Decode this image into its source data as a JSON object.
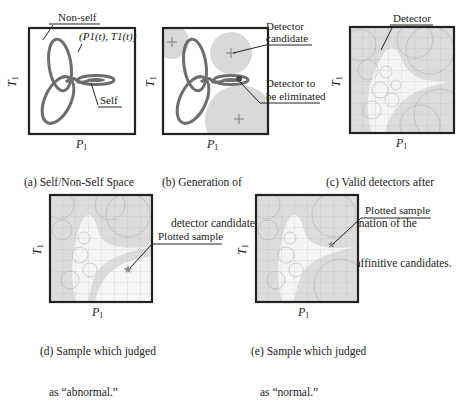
{
  "figure": {
    "panels": [
      {
        "id": "a",
        "caption": [
          "(a) Self/Non-Self Space"
        ],
        "x_axis": "P1",
        "y_axis": "T1",
        "labels": {
          "non_self": "Non-self",
          "trajectory": "(P1(t), T1(t))",
          "self": "Self"
        }
      },
      {
        "id": "b",
        "caption": [
          "(b) Generation of",
          "detector candidate."
        ],
        "x_axis": "P1",
        "y_axis": "T1",
        "labels": {
          "detector_candidate": [
            "Detector",
            "candidate"
          ],
          "detector_eliminated": [
            "Detector to",
            "be eliminated"
          ]
        },
        "marker": "+"
      },
      {
        "id": "c",
        "caption": [
          "(c) Valid detectors after",
          "elimination of the",
          "self-affinitive candidates."
        ],
        "x_axis": "P1",
        "y_axis": "T1",
        "labels": {
          "detector": "Detector"
        }
      },
      {
        "id": "d",
        "caption": [
          "(d) Sample which judged",
          "as “abnormal.”"
        ],
        "x_axis": "P1",
        "y_axis": "T1",
        "labels": {
          "plotted_sample": "Plotted sample"
        },
        "marker": "★"
      },
      {
        "id": "e",
        "caption": [
          "(e) Sample which judged",
          "as “normal.”"
        ],
        "x_axis": "P1",
        "y_axis": "T1",
        "labels": {
          "plotted_sample": "Plotted sample"
        },
        "marker": "★"
      }
    ],
    "axis": {
      "x_main": "P",
      "y_main": "T",
      "sub": "1"
    },
    "colors": {
      "frame": "#222222",
      "curve": "#6e6e6e",
      "detector_fill": "#d9d9d9",
      "grid": "#9a9a9a",
      "text": "#222222"
    }
  }
}
